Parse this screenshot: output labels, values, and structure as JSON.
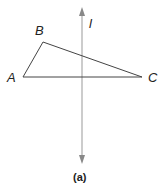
{
  "figure": {
    "caption": "(a)",
    "line_label": "l",
    "vertices": {
      "A": "A",
      "B": "B",
      "C": "C"
    },
    "colors": {
      "triangle": "#333333",
      "axis_line": "#888888",
      "text": "#222222"
    }
  }
}
